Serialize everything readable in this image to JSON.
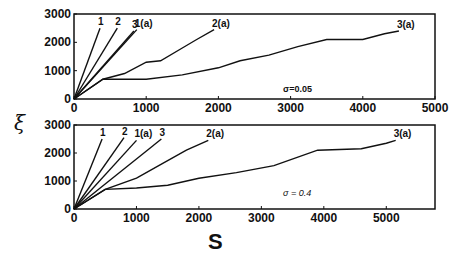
{
  "chart_data": [
    {
      "type": "line",
      "panel": "top",
      "annotation": "σ=0.05",
      "xlabel": "S",
      "ylabel": "ξ",
      "xlim": [
        0,
        5000
      ],
      "ylim": [
        0,
        3000
      ],
      "xticks": [
        0,
        1000,
        2000,
        3000,
        4000,
        5000
      ],
      "yticks": [
        0,
        1000,
        2000,
        3000
      ],
      "series": [
        {
          "name": "1",
          "x": [
            0,
            360
          ],
          "y": [
            0,
            2500
          ]
        },
        {
          "name": "2",
          "x": [
            0,
            600
          ],
          "y": [
            0,
            2500
          ]
        },
        {
          "name": "3",
          "x": [
            0,
            830
          ],
          "y": [
            0,
            2400
          ]
        },
        {
          "name": "1(a)",
          "x": [
            0,
            870
          ],
          "y": [
            0,
            2450
          ]
        },
        {
          "name": "2(a)",
          "x": [
            0,
            400,
            700,
            1000,
            1200,
            1500,
            1700,
            1940
          ],
          "y": [
            0,
            700,
            900,
            1300,
            1350,
            1800,
            2100,
            2450
          ]
        },
        {
          "name": "3(a)",
          "x": [
            0,
            400,
            1000,
            1500,
            2000,
            2300,
            2700,
            3100,
            3500,
            4000,
            4300,
            4500
          ],
          "y": [
            0,
            700,
            700,
            850,
            1100,
            1350,
            1550,
            1850,
            2100,
            2100,
            2300,
            2400
          ]
        }
      ]
    },
    {
      "type": "line",
      "panel": "bottom",
      "annotation": "σ = 0.4",
      "xlabel": "S",
      "ylabel": "ξ",
      "xlim": [
        0,
        5780
      ],
      "ylim": [
        0,
        3000
      ],
      "xticks": [
        0,
        1000,
        2000,
        3000,
        4000,
        5000
      ],
      "yticks": [
        0,
        1000,
        2000,
        3000
      ],
      "series": [
        {
          "name": "1",
          "x": [
            0,
            450
          ],
          "y": [
            0,
            2500
          ]
        },
        {
          "name": "2",
          "x": [
            0,
            800
          ],
          "y": [
            0,
            2550
          ]
        },
        {
          "name": "1(a)",
          "x": [
            0,
            1000
          ],
          "y": [
            0,
            2450
          ]
        },
        {
          "name": "3",
          "x": [
            0,
            1400
          ],
          "y": [
            0,
            2500
          ]
        },
        {
          "name": "2(a)",
          "x": [
            0,
            500,
            1000,
            1400,
            1800,
            2150
          ],
          "y": [
            0,
            700,
            1100,
            1600,
            2100,
            2450
          ]
        },
        {
          "name": "3(a)",
          "x": [
            0,
            500,
            1000,
            1500,
            2000,
            2600,
            3200,
            3900,
            4600,
            5000,
            5150
          ],
          "y": [
            0,
            700,
            750,
            850,
            1100,
            1300,
            1550,
            2100,
            2150,
            2350,
            2450
          ]
        }
      ]
    }
  ],
  "labels": {
    "xlabel": "S",
    "ylabel": "ξ",
    "top_annotation": "σ=0.05",
    "bottom_annotation": "σ = 0.4"
  }
}
